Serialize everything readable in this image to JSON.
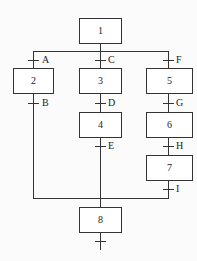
{
  "diagram": {
    "type": "sfc-grafcet",
    "steps": [
      {
        "id": "1",
        "label": "1"
      },
      {
        "id": "2",
        "label": "2"
      },
      {
        "id": "3",
        "label": "3"
      },
      {
        "id": "4",
        "label": "4"
      },
      {
        "id": "5",
        "label": "5"
      },
      {
        "id": "6",
        "label": "6"
      },
      {
        "id": "7",
        "label": "7"
      },
      {
        "id": "8",
        "label": "8"
      }
    ],
    "transitions": [
      {
        "label": "A",
        "from": "1",
        "to": "2"
      },
      {
        "label": "C",
        "from": "1",
        "to": "3"
      },
      {
        "label": "F",
        "from": "1",
        "to": "5"
      },
      {
        "label": "B",
        "from": "2",
        "to": "8"
      },
      {
        "label": "D",
        "from": "3",
        "to": "4"
      },
      {
        "label": "E",
        "from": "4",
        "to": "8"
      },
      {
        "label": "G",
        "from": "5",
        "to": "6"
      },
      {
        "label": "H",
        "from": "6",
        "to": "7"
      },
      {
        "label": "I",
        "from": "7",
        "to": "8"
      },
      {
        "label": "",
        "from": "8",
        "to": ""
      }
    ]
  },
  "colors": {
    "line": "#333333",
    "background": "#fbfbfb"
  }
}
